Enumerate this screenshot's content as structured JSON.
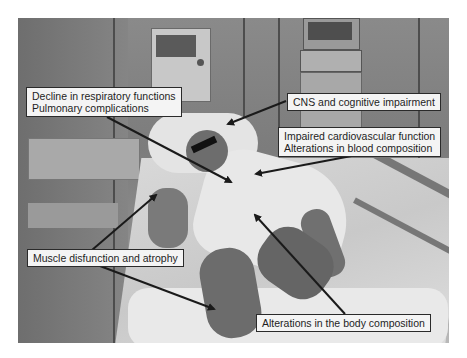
{
  "figure": {
    "colors": {
      "label_background": "#f4f4f4",
      "label_border": "#2a2a2a",
      "arrow": "#1a1a1a",
      "text": "#1e1e1e"
    }
  },
  "labels": {
    "respiratory": {
      "line1": "Decline in respiratory functions",
      "line2": "Pulmonary complications"
    },
    "cns": {
      "line1": "CNS and cognitive impairment"
    },
    "cardio": {
      "line1": "Impaired cardiovascular function",
      "line2": "Alterations in blood composition"
    },
    "muscle": {
      "line1": "Muscle disfunction and atrophy"
    },
    "body_composition": {
      "line1": "Alterations in the body composition"
    }
  }
}
